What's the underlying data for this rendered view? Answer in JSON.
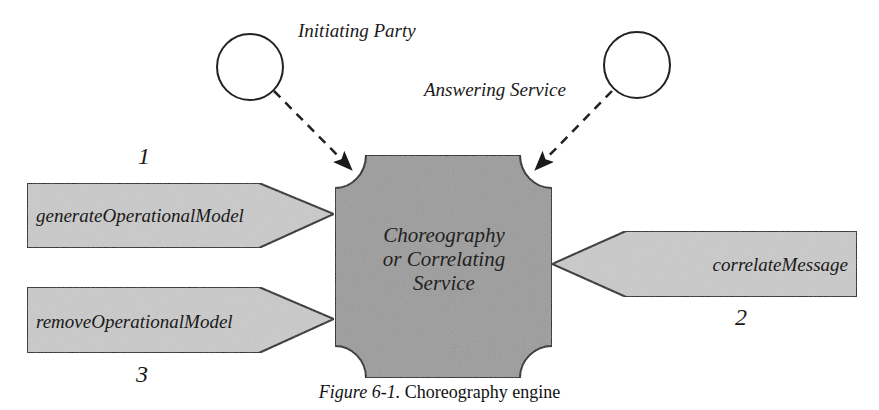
{
  "diagram": {
    "actors": [
      {
        "id": "initiating-party",
        "label": "Initiating Party"
      },
      {
        "id": "answering-service",
        "label": "Answering Service"
      }
    ],
    "center": {
      "lines": [
        "Choreography",
        "or Correlating",
        "Service"
      ]
    },
    "operations": [
      {
        "label": "generateOperationalModel",
        "step": "1"
      },
      {
        "label": "correlateMessage",
        "step": "2"
      },
      {
        "label": "removeOperationalModel",
        "step": "3"
      }
    ],
    "colors": {
      "center_fill": "#9c9c9c",
      "operation_fill": "#cacaca",
      "stroke": "#222222",
      "background": "#ffffff"
    }
  },
  "caption": {
    "figure_label": "Figure 6-1.",
    "text": " Choreography engine"
  }
}
